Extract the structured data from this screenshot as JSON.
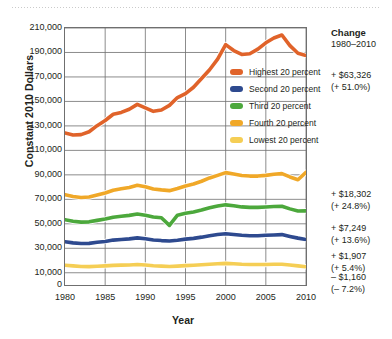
{
  "chart_data": {
    "type": "line",
    "title": "",
    "xlabel": "Year",
    "ylabel": "Constant 2010 Dollars",
    "xlim": [
      1980,
      2010
    ],
    "ylim": [
      0,
      210000
    ],
    "xticks": [
      "1980",
      "1985",
      "1990",
      "1995",
      "2000",
      "2005",
      "2010"
    ],
    "yticks": [
      "0",
      "10,000",
      "30,000",
      "50,000",
      "70,000",
      "90,000",
      "110,000",
      "130,000",
      "150,000",
      "170,000",
      "190,000",
      "210,000"
    ],
    "grid": true,
    "legend_position": "inside-right",
    "x": [
      1980,
      1981,
      1982,
      1983,
      1984,
      1985,
      1986,
      1987,
      1988,
      1989,
      1990,
      1991,
      1992,
      1993,
      1994,
      1995,
      1996,
      1997,
      1998,
      1999,
      2000,
      2001,
      2002,
      2003,
      2004,
      2005,
      2006,
      2007,
      2008,
      2009,
      2010
    ],
    "series": [
      {
        "name": "Highest 20 percent",
        "color": "#E0632A",
        "values": [
          124200,
          122600,
          122900,
          125200,
          130200,
          134400,
          139500,
          141000,
          143600,
          147600,
          144800,
          141900,
          143000,
          146800,
          153200,
          156400,
          161600,
          168700,
          175900,
          184600,
          196400,
          191600,
          188400,
          189000,
          192700,
          197900,
          201800,
          204300,
          195600,
          189400,
          187526
        ]
      },
      {
        "name": "Second 20 percent",
        "color": "#2E4A8F",
        "values": [
          35300,
          34400,
          33900,
          34000,
          34900,
          35600,
          36700,
          37200,
          37700,
          38500,
          37800,
          36800,
          36300,
          36000,
          36600,
          37500,
          38100,
          39100,
          40300,
          41200,
          41900,
          41300,
          40600,
          40300,
          40300,
          40600,
          40900,
          41200,
          39700,
          38300,
          37207
        ]
      },
      {
        "name": "Third 20 percent",
        "color": "#4CA83C",
        "values": [
          53300,
          52100,
          51400,
          51600,
          52800,
          53900,
          55400,
          56200,
          56900,
          58000,
          57000,
          55600,
          54900,
          48700,
          57000,
          58600,
          59600,
          61200,
          63100,
          64500,
          65500,
          64800,
          63800,
          63400,
          63400,
          63700,
          64100,
          64400,
          62200,
          60500,
          60547
        ]
      },
      {
        "name": "Fourth 20 percent",
        "color": "#F0A828",
        "values": [
          73800,
          72300,
          71500,
          71900,
          73500,
          75200,
          77400,
          78600,
          79700,
          81500,
          80300,
          78500,
          77700,
          77100,
          78800,
          80900,
          82500,
          84800,
          87500,
          89600,
          91800,
          90700,
          89500,
          89000,
          89000,
          89600,
          90500,
          91000,
          88300,
          86000,
          92102
        ]
      },
      {
        "name": "Lowest 20 percent",
        "color": "#F5CE55",
        "values": [
          16100,
          15600,
          15100,
          15000,
          15300,
          15600,
          16000,
          16200,
          16400,
          16700,
          16300,
          15700,
          15400,
          15100,
          15400,
          15800,
          16100,
          16500,
          17000,
          17400,
          17700,
          17400,
          17000,
          16800,
          16800,
          16800,
          16900,
          17000,
          16300,
          15600,
          14940
        ]
      }
    ],
    "annotations": {
      "header": "Change",
      "subheader": "1980–2010",
      "items": [
        {
          "series": "Highest 20 percent",
          "amount": "+ $63,326",
          "percent": "(+ 51.0%)"
        },
        {
          "series": "Fourth 20 percent",
          "amount": "+ $18,302",
          "percent": "(+ 24.8%)"
        },
        {
          "series": "Third 20 percent",
          "amount": "+ $7,249",
          "percent": "(+ 13.6%)"
        },
        {
          "series": "Second 20 percent",
          "amount": "+ $1,907",
          "percent": "(+ 5.4%)"
        },
        {
          "series": "Lowest 20 percent",
          "amount": "– $1,160",
          "percent": "(– 7.2%)"
        }
      ]
    }
  }
}
